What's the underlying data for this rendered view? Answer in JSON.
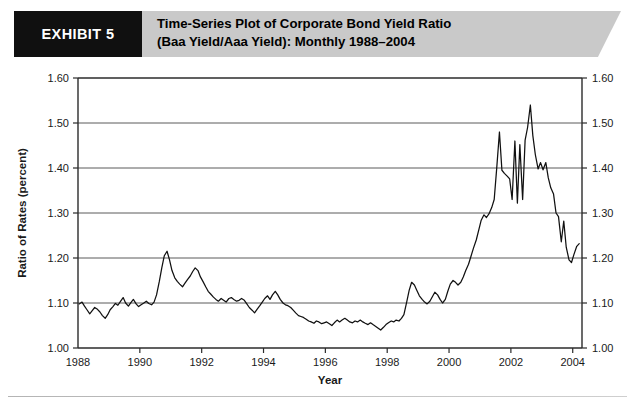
{
  "header": {
    "exhibit_tag": "EXHIBIT 5",
    "title_line1": "Time-Series Plot of Corporate Bond Yield Ratio",
    "title_line2": "(Baa Yield/Aaa Yield): Monthly 1988–2004",
    "tag_background": "#101010",
    "banner_background": "#c9c9c9"
  },
  "chart_data": {
    "type": "line",
    "title": "Time-Series Plot of Corporate Bond Yield Ratio (Baa Yield/Aaa Yield): Monthly 1988–2004",
    "xlabel": "Year",
    "ylabel": "Ratio of Rates (percent)",
    "xlim": [
      1988.0,
      2004.3
    ],
    "ylim": [
      1.0,
      1.6
    ],
    "ytick_labels": [
      "1.00",
      "1.10",
      "1.20",
      "1.30",
      "1.40",
      "1.50",
      "1.60"
    ],
    "ytick_values": [
      1.0,
      1.1,
      1.2,
      1.3,
      1.4,
      1.5,
      1.6
    ],
    "xtick_labels": [
      "1988",
      "1990",
      "1992",
      "1994",
      "1996",
      "1998",
      "2000",
      "2002",
      "2004"
    ],
    "xtick_values": [
      1988,
      1990,
      1992,
      1994,
      1996,
      1998,
      2000,
      2002,
      2004
    ],
    "grid": "horizontal",
    "legend": "none",
    "right_axis_labels": [
      "1.00",
      "1.10",
      "1.20",
      "1.30",
      "1.40",
      "1.50",
      "1.60"
    ],
    "line_color": "#111111",
    "series": [
      {
        "name": "Baa Yield / Aaa Yield",
        "x": [
          1988.04,
          1988.13,
          1988.21,
          1988.29,
          1988.38,
          1988.46,
          1988.54,
          1988.63,
          1988.71,
          1988.79,
          1988.88,
          1988.96,
          1989.04,
          1989.13,
          1989.21,
          1989.29,
          1989.38,
          1989.46,
          1989.54,
          1989.63,
          1989.71,
          1989.79,
          1989.88,
          1989.96,
          1990.04,
          1990.13,
          1990.21,
          1990.29,
          1990.38,
          1990.46,
          1990.54,
          1990.63,
          1990.71,
          1990.79,
          1990.88,
          1990.96,
          1991.04,
          1991.13,
          1991.21,
          1991.29,
          1991.38,
          1991.46,
          1991.54,
          1991.63,
          1991.71,
          1991.79,
          1991.88,
          1991.96,
          1992.04,
          1992.13,
          1992.21,
          1992.29,
          1992.38,
          1992.46,
          1992.54,
          1992.63,
          1992.71,
          1992.79,
          1992.88,
          1992.96,
          1993.04,
          1993.13,
          1993.21,
          1993.29,
          1993.38,
          1993.46,
          1993.54,
          1993.63,
          1993.71,
          1993.79,
          1993.88,
          1993.96,
          1994.04,
          1994.13,
          1994.21,
          1994.29,
          1994.38,
          1994.46,
          1994.54,
          1994.63,
          1994.71,
          1994.79,
          1994.88,
          1994.96,
          1995.04,
          1995.13,
          1995.21,
          1995.29,
          1995.38,
          1995.46,
          1995.54,
          1995.63,
          1995.71,
          1995.79,
          1995.88,
          1995.96,
          1996.04,
          1996.13,
          1996.21,
          1996.29,
          1996.38,
          1996.46,
          1996.54,
          1996.63,
          1996.71,
          1996.79,
          1996.88,
          1996.96,
          1997.04,
          1997.13,
          1997.21,
          1997.29,
          1997.38,
          1997.46,
          1997.54,
          1997.63,
          1997.71,
          1997.79,
          1997.88,
          1997.96,
          1998.04,
          1998.13,
          1998.21,
          1998.29,
          1998.38,
          1998.46,
          1998.54,
          1998.63,
          1998.71,
          1998.79,
          1998.88,
          1998.96,
          1999.04,
          1999.13,
          1999.21,
          1999.29,
          1999.38,
          1999.46,
          1999.54,
          1999.63,
          1999.71,
          1999.79,
          1999.88,
          1999.96,
          2000.04,
          2000.13,
          2000.21,
          2000.29,
          2000.38,
          2000.46,
          2000.54,
          2000.63,
          2000.71,
          2000.79,
          2000.88,
          2000.96,
          2001.04,
          2001.13,
          2001.21,
          2001.29,
          2001.38,
          2001.46,
          2001.54,
          2001.63,
          2001.71,
          2001.79,
          2001.88,
          2001.96,
          2002.04,
          2002.13,
          2002.21,
          2002.29,
          2002.38,
          2002.46,
          2002.54,
          2002.63,
          2002.71,
          2002.79,
          2002.88,
          2002.96,
          2003.04,
          2003.13,
          2003.21,
          2003.29,
          2003.38,
          2003.46,
          2003.54,
          2003.63,
          2003.71,
          2003.79,
          2003.88,
          2003.96,
          2004.04,
          2004.13,
          2004.21
        ],
        "values": [
          1.098,
          1.102,
          1.093,
          1.085,
          1.076,
          1.083,
          1.09,
          1.086,
          1.08,
          1.072,
          1.066,
          1.074,
          1.085,
          1.092,
          1.099,
          1.095,
          1.104,
          1.112,
          1.1,
          1.093,
          1.101,
          1.108,
          1.098,
          1.092,
          1.096,
          1.1,
          1.104,
          1.099,
          1.096,
          1.102,
          1.118,
          1.148,
          1.178,
          1.205,
          1.215,
          1.196,
          1.172,
          1.156,
          1.148,
          1.142,
          1.136,
          1.144,
          1.152,
          1.16,
          1.17,
          1.178,
          1.172,
          1.158,
          1.148,
          1.136,
          1.126,
          1.12,
          1.113,
          1.108,
          1.104,
          1.11,
          1.106,
          1.102,
          1.11,
          1.112,
          1.108,
          1.104,
          1.106,
          1.11,
          1.106,
          1.098,
          1.09,
          1.084,
          1.078,
          1.086,
          1.094,
          1.102,
          1.11,
          1.116,
          1.108,
          1.118,
          1.126,
          1.118,
          1.108,
          1.1,
          1.096,
          1.094,
          1.09,
          1.084,
          1.078,
          1.072,
          1.07,
          1.068,
          1.064,
          1.06,
          1.058,
          1.055,
          1.06,
          1.058,
          1.054,
          1.056,
          1.058,
          1.054,
          1.05,
          1.056,
          1.062,
          1.058,
          1.062,
          1.066,
          1.062,
          1.058,
          1.056,
          1.06,
          1.058,
          1.062,
          1.058,
          1.055,
          1.052,
          1.056,
          1.052,
          1.048,
          1.044,
          1.04,
          1.046,
          1.052,
          1.056,
          1.06,
          1.058,
          1.062,
          1.06,
          1.066,
          1.074,
          1.102,
          1.128,
          1.146,
          1.14,
          1.128,
          1.116,
          1.108,
          1.102,
          1.098,
          1.104,
          1.114,
          1.124,
          1.118,
          1.108,
          1.1,
          1.108,
          1.126,
          1.142,
          1.15,
          1.146,
          1.14,
          1.146,
          1.158,
          1.172,
          1.186,
          1.204,
          1.222,
          1.24,
          1.262,
          1.284,
          1.296,
          1.29,
          1.298,
          1.312,
          1.33,
          1.398,
          1.48,
          1.395,
          1.388,
          1.382,
          1.376,
          1.33,
          1.46,
          1.322,
          1.452,
          1.33,
          1.462,
          1.49,
          1.54,
          1.472,
          1.43,
          1.398,
          1.412,
          1.396,
          1.412,
          1.378,
          1.356,
          1.342,
          1.3,
          1.292,
          1.236,
          1.282,
          1.224,
          1.196,
          1.19,
          1.208,
          1.226,
          1.232
        ]
      }
    ]
  },
  "axis": {
    "ylabel": "Ratio of Rates (percent)",
    "xlabel": "Year"
  }
}
